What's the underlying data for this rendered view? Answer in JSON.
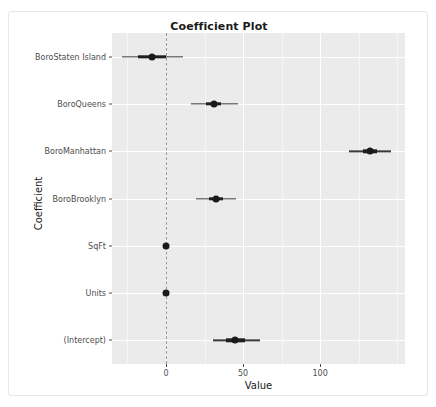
{
  "chart_data": {
    "type": "scatter",
    "title": "Coefficient Plot",
    "xlabel": "Value",
    "ylabel": "Coefficient",
    "xlim": [
      -35,
      155
    ],
    "xticks": [
      0,
      50,
      100
    ],
    "xtick_labels": [
      "0",
      "50",
      "100"
    ],
    "grid": true,
    "legend": "none",
    "reference_line": {
      "value": 0,
      "style": "dashed",
      "color": "#9a9a9a"
    },
    "categories": [
      "BoroStaten Island",
      "BoroQueens",
      "BoroManhattan",
      "BoroBrooklyn",
      "SqFt",
      "Units",
      "(Intercept)"
    ],
    "series": [
      {
        "name": "Coefficient estimate with 1 and 2 standard-error bands",
        "points": [
          {
            "label": "BoroStaten Island",
            "value": -9.0,
            "inner_low": -18.0,
            "inner_high": 0.0,
            "outer_low": -28.5,
            "outer_high": 11.0
          },
          {
            "label": "BoroQueens",
            "value": 31.0,
            "inner_low": 26.0,
            "inner_high": 36.0,
            "outer_low": 16.0,
            "outer_high": 46.5
          },
          {
            "label": "BoroManhattan",
            "value": 132.5,
            "inner_low": 128.0,
            "inner_high": 137.0,
            "outer_low": 118.5,
            "outer_high": 146.0
          },
          {
            "label": "BoroBrooklyn",
            "value": 32.5,
            "inner_low": 28.0,
            "inner_high": 37.0,
            "outer_low": 19.5,
            "outer_high": 45.5
          },
          {
            "label": "SqFt",
            "value": 0.0,
            "inner_low": 0.0,
            "inner_high": 0.0,
            "outer_low": 0.0,
            "outer_high": 0.0
          },
          {
            "label": "Units",
            "value": 0.0,
            "inner_low": 0.0,
            "inner_high": 0.0,
            "outer_low": 0.0,
            "outer_high": 0.0
          },
          {
            "label": "(Intercept)",
            "value": 45.0,
            "inner_low": 39.0,
            "inner_high": 51.0,
            "outer_low": 30.5,
            "outer_high": 61.0
          }
        ]
      }
    ],
    "colors": {
      "panel_background": "#ebebeb",
      "grid_major": "#ffffff",
      "grid_minor": "#f5f5f5",
      "point": "#1a1a1a",
      "reference_line": "#9a9a9a",
      "tick_text": "#4d4d4d",
      "title_text": "#1a1a1a",
      "card_border": "#e6e6e6",
      "page_background": "#ffffff"
    }
  }
}
